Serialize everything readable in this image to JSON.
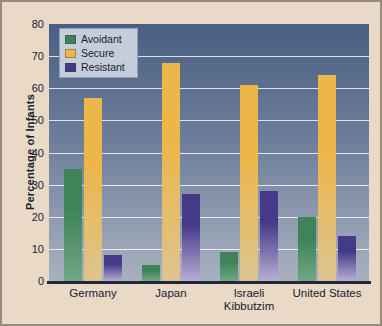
{
  "figure": {
    "ylabel": "Percentage of Infants"
  },
  "chart_data": {
    "type": "bar",
    "categories": [
      "Germany",
      "Japan",
      "Israeli Kibbutzim",
      "United States"
    ],
    "series": [
      {
        "name": "Avoidant",
        "color": "#3e8458",
        "color_bottom": "#72a685",
        "values": [
          35,
          5,
          9,
          20
        ]
      },
      {
        "name": "Secure",
        "color": "#ecb649",
        "color_bottom": "#ddc48f",
        "values": [
          57,
          68,
          61,
          64
        ]
      },
      {
        "name": "Resistant",
        "color": "#453a88",
        "color_bottom": "#b7aed3",
        "values": [
          8,
          27,
          28,
          14
        ]
      }
    ],
    "ylabel": "Percentage of Infants",
    "xlabel": "",
    "ylim": [
      0,
      80
    ],
    "yticks": [
      0,
      10,
      20,
      30,
      40,
      50,
      60,
      70,
      80
    ],
    "grid": true,
    "legend_position": "top-left"
  },
  "colors": {
    "page_background": "#e9d9c6",
    "page_border": "#978c7c",
    "plot_gradient_top": "#4a5f82",
    "plot_gradient_bottom": "#a8b1c0",
    "gridline": "#ffffff",
    "axis_line": "#1e2836",
    "text": "#16222f",
    "legend_background": "#c4ceda",
    "legend_border": "#93a0b0"
  }
}
